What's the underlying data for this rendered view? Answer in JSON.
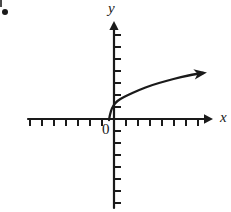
{
  "figure": {
    "kind": "cartesian-graph",
    "background_color": "#ffffff",
    "ink_color": "#1a1a1a",
    "bullet": {
      "name": "item-bullet",
      "shape": "filled-dot",
      "x": 5,
      "y": 12
    },
    "labels": {
      "y_axis": "y",
      "x_axis": "x",
      "origin": "0"
    },
    "axes": {
      "origin": {
        "x": 114,
        "y": 119
      },
      "x_axis": {
        "start_x": 28,
        "end_x": 212,
        "y": 119,
        "arrow": "right",
        "tick_spacing": 12,
        "tick_length": 7,
        "tick_direction": "down",
        "ticks_left_of_origin": 7,
        "ticks_right_of_origin": 7
      },
      "y_axis": {
        "start_y": 208,
        "end_y": 22,
        "x": 114,
        "arrow": "up",
        "tick_spacing": 12,
        "tick_length": 7,
        "tick_direction": "right",
        "ticks_above_origin": 7,
        "ticks_below_origin": 7
      }
    }
  },
  "chart_data": {
    "type": "line",
    "title": "",
    "xlabel": "x",
    "ylabel": "y",
    "grid": false,
    "legend": null,
    "annotations": [
      "0"
    ],
    "curve_name": "square-root-shaped increasing curve",
    "arrow_end": "right",
    "xlim": [
      -7.2,
      8.2
    ],
    "ylim": [
      -7.4,
      8.1
    ],
    "series": [
      {
        "name": "square-root curve",
        "stroke": "#1a1a1a",
        "stroke_width": 2.3,
        "points_px": [
          [
            109,
            120
          ],
          [
            110,
            114
          ],
          [
            112,
            108
          ],
          [
            115,
            103
          ],
          [
            120,
            99
          ],
          [
            128,
            95
          ],
          [
            139,
            90
          ],
          [
            152,
            85
          ],
          [
            166,
            81
          ],
          [
            181,
            77
          ],
          [
            196,
            74
          ],
          [
            203,
            73
          ]
        ],
        "x": [
          -0.42,
          -0.33,
          -0.17,
          0.08,
          0.5,
          1.17,
          2.08,
          3.17,
          4.33,
          5.58,
          6.83,
          7.42
        ],
        "y": [
          -0.08,
          0.42,
          0.92,
          1.33,
          1.67,
          2.0,
          2.42,
          2.83,
          3.17,
          3.5,
          3.75,
          3.83
        ]
      }
    ]
  }
}
